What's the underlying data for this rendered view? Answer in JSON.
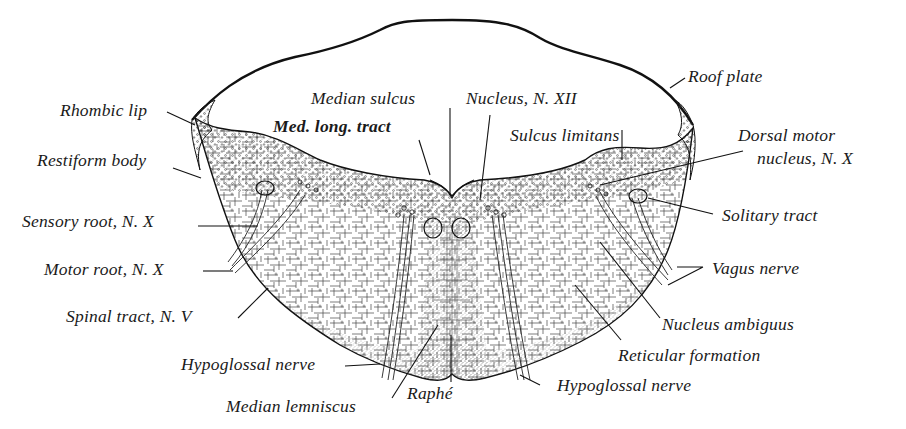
{
  "figure": {
    "colors": {
      "ink": "#1a1a1a",
      "background": "#ffffff",
      "stipple": "#3a3a3a"
    }
  },
  "labels": {
    "roof_plate": "Roof plate",
    "rhombic_lip": "Rhombic lip",
    "median_sulcus": "Median sulcus",
    "nucleus_n_xii": "Nucleus, N. XII",
    "med_long_tract": "Med. long. tract",
    "sulcus_limitans": "Sulcus limitans",
    "restiform_body": "Restiform body",
    "dorsal_motor_nucleus_1": "Dorsal motor",
    "dorsal_motor_nucleus_2": "nucleus, N. X",
    "sensory_root": "Sensory root, N. X",
    "solitary_tract": "Solitary tract",
    "motor_root": "Motor root, N. X",
    "vagus_nerve": "Vagus nerve",
    "spinal_tract": "Spinal tract, N. V",
    "nucleus_ambiguus": "Nucleus ambiguus",
    "hypoglossal_nerve_left": "Hypoglossal nerve",
    "reticular_formation": "Reticular formation",
    "raphe": "Raphé",
    "hypoglossal_nerve_right": "Hypoglossal nerve",
    "median_lemniscus": "Median lemniscus"
  }
}
